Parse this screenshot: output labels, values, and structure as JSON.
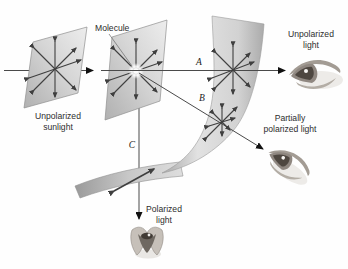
{
  "figure": {
    "type": "physics-diagram"
  },
  "labels": {
    "molecule": "Molecule",
    "unpolarized_sunlight": [
      "Unpolarized",
      "sunlight"
    ],
    "ray_a": "A",
    "ray_b": "B",
    "ray_c": "C",
    "unpolarized_light": [
      "Unpolarized",
      "light"
    ],
    "partially_polarized_light": [
      "Partially",
      "polarized light"
    ],
    "polarized_light": [
      "Polarized",
      "light"
    ]
  },
  "icons": {
    "eye_side": "eye-icon",
    "eye_top": "eye-icon"
  },
  "palette": {
    "background": "#fefefe",
    "panel_light": "#ebebeb",
    "panel_dark": "#b3b3b3",
    "sheet_dark": "#a8a8a8",
    "oscillation_arrow": "#3f3f3f",
    "ray_line": "#4a4a4a",
    "direction_arrow": "#111111",
    "text": "#2d2d2d"
  }
}
